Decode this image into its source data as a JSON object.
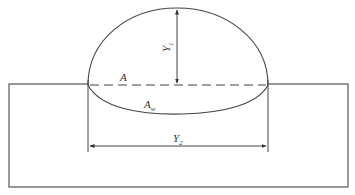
{
  "diagram": {
    "type": "weld bead cross-section",
    "labels": {
      "reinforcement_area": "A",
      "penetration_area": "A",
      "penetration_area_sub": "w",
      "height": "Y",
      "height_sub": "1",
      "width": "Y",
      "width_sub": "2"
    },
    "colors": {
      "stroke": "#4a4a4a",
      "background": "#ffffff"
    }
  }
}
